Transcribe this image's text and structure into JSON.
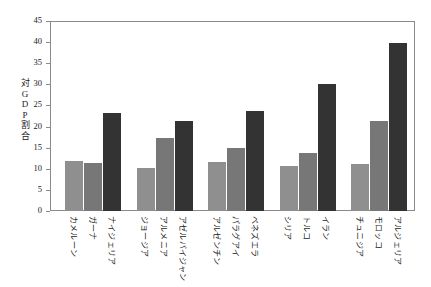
{
  "chart_data": {
    "type": "bar",
    "title": "",
    "subtitle": "",
    "xlabel": "",
    "ylabel": "対GDP割合",
    "ylabel_chars": [
      "対",
      "G",
      "D",
      "P",
      "割",
      "合"
    ],
    "ylim": [
      0,
      45
    ],
    "ytick_step": 5,
    "yticks": [
      0,
      5,
      10,
      15,
      20,
      25,
      30,
      35,
      40,
      45
    ],
    "ytick_labels": [
      "0",
      "5",
      "10",
      "15",
      "20",
      "25",
      "30",
      "35",
      "40",
      "45"
    ],
    "grid": false,
    "legend": "none",
    "orientation": "vertical",
    "categories": [
      "カメルーン",
      "ガーナ",
      "ナイジェリア",
      "ジョージア",
      "アルメニア",
      "アゼルバイジャン",
      "アルゼンチン",
      "パラグアイ",
      "ベネズエラ",
      "シリア",
      "トルコ",
      "イラン",
      "チュニジア",
      "モロッコ",
      "アルジェリア"
    ],
    "values": [
      11.8,
      11.4,
      23.1,
      10.3,
      17.4,
      21.3,
      11.5,
      14.9,
      23.6,
      10.7,
      13.8,
      30.0,
      11.2,
      21.3,
      39.8
    ],
    "bar_colors": [
      "#8f8f8f",
      "#777777",
      "#333333",
      "#8f8f8f",
      "#777777",
      "#333333",
      "#8f8f8f",
      "#777777",
      "#333333",
      "#8f8f8f",
      "#777777",
      "#333333",
      "#8f8f8f",
      "#777777",
      "#333333"
    ],
    "groups": [
      {
        "name": "group-1",
        "categories": [
          "カメルーン",
          "ガーナ",
          "ナイジェリア"
        ],
        "values": [
          11.8,
          11.4,
          23.1
        ]
      },
      {
        "name": "group-2",
        "categories": [
          "ジョージア",
          "アルメニア",
          "アゼルバイジャン"
        ],
        "values": [
          10.3,
          17.4,
          21.3
        ]
      },
      {
        "name": "group-3",
        "categories": [
          "アルゼンチン",
          "パラグアイ",
          "ベネズエラ"
        ],
        "values": [
          11.5,
          14.9,
          23.6
        ]
      },
      {
        "name": "group-4",
        "categories": [
          "シリア",
          "トルコ",
          "イラン"
        ],
        "values": [
          10.7,
          13.8,
          30.0
        ]
      },
      {
        "name": "group-5",
        "categories": [
          "チュニジア",
          "モロッコ",
          "アルジェリア"
        ],
        "values": [
          11.2,
          21.3,
          39.8
        ]
      }
    ],
    "colors": {
      "series_light": "#8f8f8f",
      "series_medium": "#777777",
      "series_dark": "#333333",
      "axis": "#8a8a8a",
      "text": "#1a1a1a",
      "background": "#ffffff"
    }
  }
}
